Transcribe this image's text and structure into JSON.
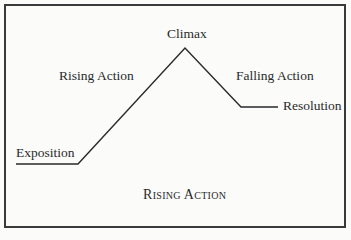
{
  "diagram": {
    "type": "plot-structure",
    "caption": "Rising Action",
    "labels": {
      "exposition": "Exposition",
      "rising_action": "Rising Action",
      "climax": "Climax",
      "falling_action": "Falling Action",
      "resolution": "Resolution"
    },
    "line_points": [
      [
        16,
        164
      ],
      [
        78,
        164
      ],
      [
        185,
        48
      ],
      [
        241,
        107
      ],
      [
        278,
        107
      ]
    ],
    "colors": {
      "line": "#2a2a2a",
      "border": "#3a3a3a",
      "background": "#fbfbfa"
    }
  }
}
